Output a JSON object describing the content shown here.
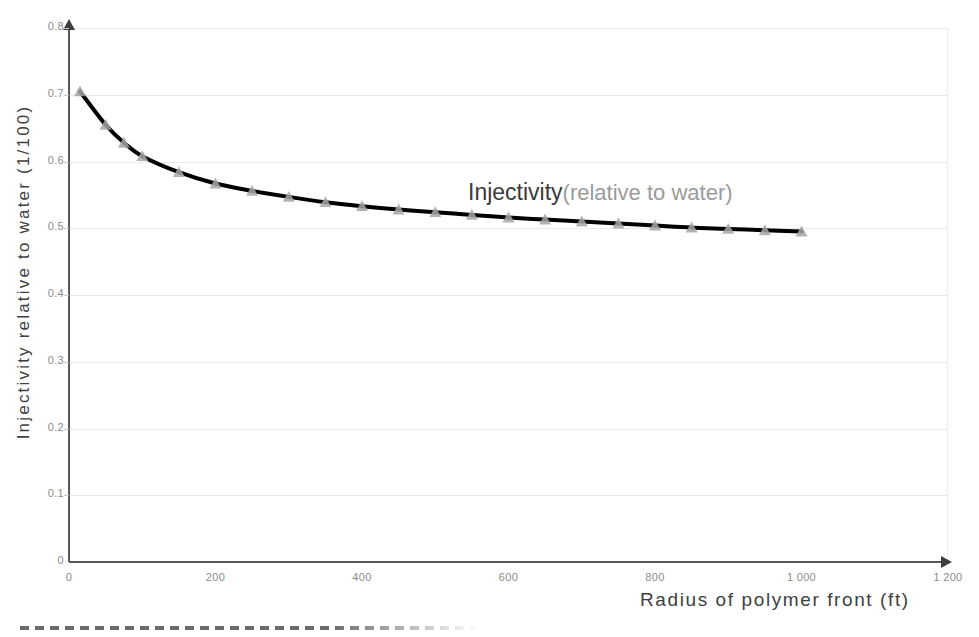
{
  "chart_data": {
    "type": "line",
    "title": "",
    "xlabel": "Radius of polymer front (ft)",
    "ylabel": "Injectivity relative to water (1/100)",
    "xlim": [
      0,
      1200
    ],
    "ylim": [
      0,
      0.8
    ],
    "grid": true,
    "legend_position": "inline-annotation",
    "annotation_main": "Injectivity",
    "annotation_sub": "(relative to water)",
    "xticks": [
      "0",
      "200",
      "400",
      "600",
      "800",
      "1 000",
      "1 200"
    ],
    "xtick_values": [
      0,
      200,
      400,
      600,
      800,
      1000,
      1200
    ],
    "yticks": [
      "0",
      "0.1",
      "0.2",
      "0.3",
      "0.4",
      "0.5",
      "0.6",
      "0.7",
      "0.8"
    ],
    "ytick_values": [
      0,
      0.1,
      0.2,
      0.3,
      0.4,
      0.5,
      0.6,
      0.7,
      0.8
    ],
    "series": [
      {
        "name": "Injectivity (relative to water)",
        "line_color": "#000000",
        "marker": "triangle",
        "marker_color": "#a6a6a6",
        "x": [
          15,
          50,
          75,
          100,
          150,
          200,
          250,
          300,
          350,
          400,
          450,
          500,
          550,
          600,
          650,
          700,
          750,
          800,
          850,
          900,
          950,
          1000
        ],
        "y": [
          0.705,
          0.655,
          0.628,
          0.608,
          0.584,
          0.567,
          0.556,
          0.547,
          0.539,
          0.533,
          0.528,
          0.524,
          0.52,
          0.516,
          0.513,
          0.51,
          0.507,
          0.504,
          0.501,
          0.499,
          0.497,
          0.495
        ]
      }
    ]
  },
  "colors": {
    "line": "#000000",
    "marker": "#a6a6a6",
    "axis": "#595959",
    "grid": "#e9e9e9",
    "tick_text": "#8c8c8c",
    "axis_title": "#404040",
    "annotation_main": "#3a3a3a",
    "annotation_sub": "#9b9b9b"
  }
}
